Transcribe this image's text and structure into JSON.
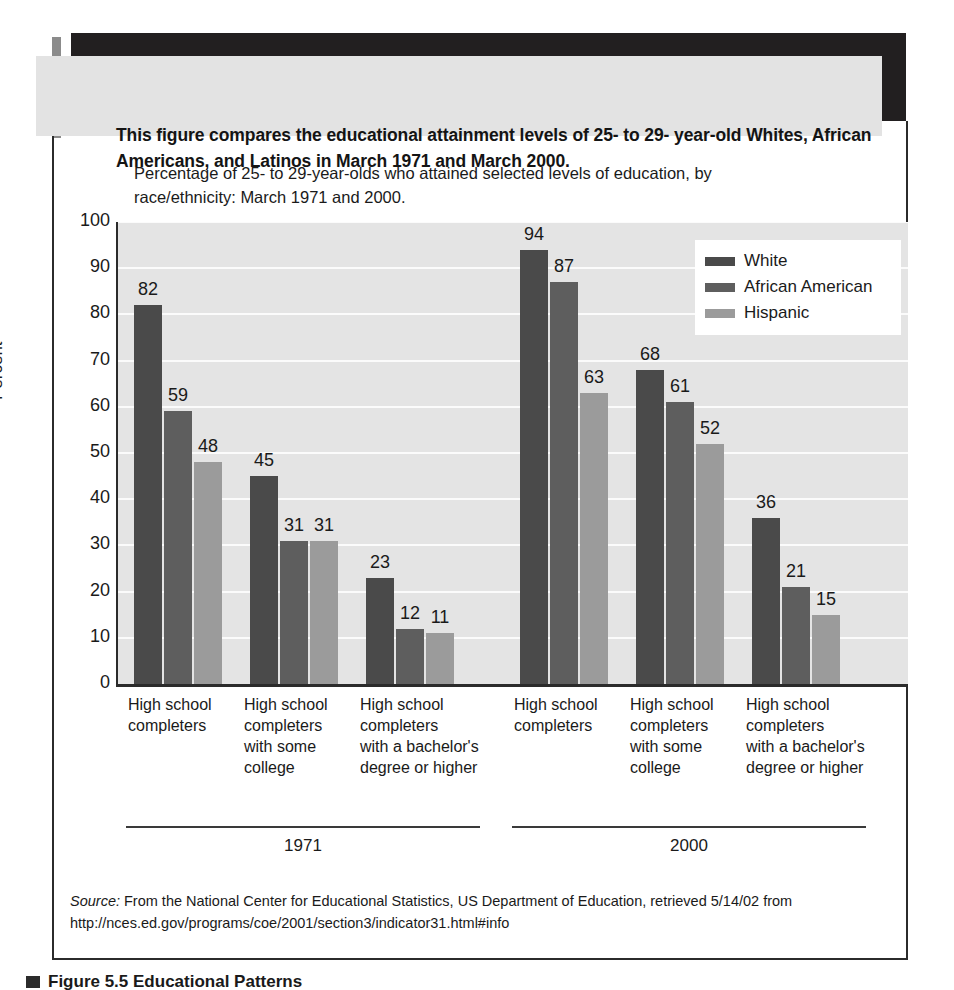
{
  "callout": {
    "text": "This figure compares the educational attainment levels of 25- to 29- year-old Whites, African Americans, and Latinos in March 1971 and March 2000."
  },
  "chart_title": "Percentage of 25- to 29-year-olds who attained selected levels of education, by race/ethnicity: March 1971 and 2000.",
  "legend": {
    "items": [
      {
        "label": "White",
        "color": "#4a4a4a"
      },
      {
        "label": "African American",
        "color": "#5e5e5e"
      },
      {
        "label": "Hispanic",
        "color": "#9b9b9b"
      }
    ]
  },
  "periods": [
    {
      "label": "1971"
    },
    {
      "label": "2000"
    }
  ],
  "categories_display": [
    "High school\ncompleters",
    "High school\ncompleters\nwith some\ncollege",
    "High school\ncompleters\nwith a bachelor's\ndegree or higher",
    "High school\ncompleters",
    "High school\ncompleters\nwith some\ncollege",
    "High school\ncompleters\nwith a bachelor's\ndegree or higher"
  ],
  "source_note": {
    "lead": "Source:",
    "body": " From the National Center for Educational Statistics, US Department of Education, retrieved 5/14/02 from http://nces.ed.gov/programs/coe/2001/section3/indicator31.html#info"
  },
  "bottom_caption": "Figure 5.5 Educational Patterns",
  "chart_data": {
    "type": "bar",
    "title": "Percentage of 25- to 29-year-olds who attained selected levels of education, by race/ethnicity: March 1971 and 2000.",
    "xlabel": "",
    "ylabel": "Percent",
    "ylim": [
      0,
      100
    ],
    "ytick_step": 10,
    "yticks": [
      0,
      10,
      20,
      30,
      40,
      50,
      60,
      70,
      80,
      90,
      100
    ],
    "grid": true,
    "legend_position": "top-right",
    "grouped": true,
    "categories": [
      "1971 - High school completers",
      "1971 - High school completers with some college",
      "1971 - High school completers with a bachelor's degree or higher",
      "2000 - High school completers",
      "2000 - High school completers with some college",
      "2000 - High school completers with a bachelor's degree or higher"
    ],
    "series": [
      {
        "name": "White",
        "color": "#4a4a4a",
        "values": [
          82,
          45,
          23,
          94,
          68,
          36
        ]
      },
      {
        "name": "African American",
        "color": "#5e5e5e",
        "values": [
          59,
          31,
          12,
          87,
          61,
          21
        ]
      },
      {
        "name": "Hispanic",
        "color": "#9b9b9b",
        "values": [
          48,
          31,
          11,
          63,
          52,
          15
        ]
      }
    ]
  }
}
